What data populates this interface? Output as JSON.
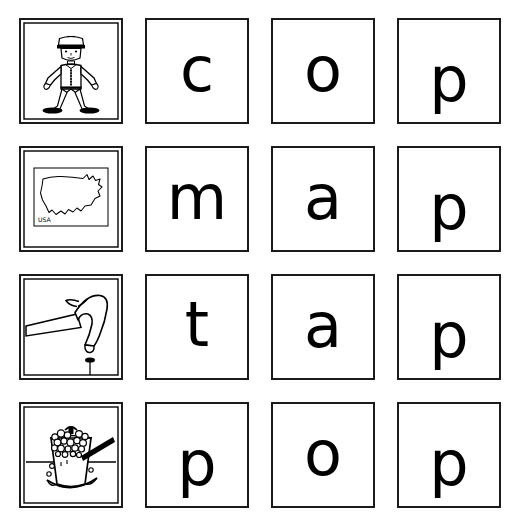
{
  "worksheet": {
    "title": "Picture and letter matching worksheet",
    "columns": 4,
    "rows": 4,
    "background_color": "#ffffff",
    "ink_color": "#000000",
    "border_color": "#1b1b1b"
  },
  "rows": [
    {
      "word": "cop",
      "picture": {
        "icon_name": "policeman-icon",
        "alt_label": "policeman",
        "inner_label": ""
      },
      "letters": [
        "c",
        "o",
        "p"
      ]
    },
    {
      "word": "map",
      "picture": {
        "icon_name": "usa-map-icon",
        "alt_label": "map of the United States",
        "inner_label": "USA"
      },
      "letters": [
        "m",
        "a",
        "p"
      ]
    },
    {
      "word": "tap",
      "picture": {
        "icon_name": "hammer-nail-icon",
        "alt_label": "hammer tapping a nail",
        "inner_label": ""
      },
      "letters": [
        "t",
        "a",
        "p"
      ]
    },
    {
      "word": "pop",
      "picture": {
        "icon_name": "popcorn-pot-icon",
        "alt_label": "pot of popcorn popping",
        "inner_label": ""
      },
      "letters": [
        "p",
        "o",
        "p"
      ]
    }
  ]
}
